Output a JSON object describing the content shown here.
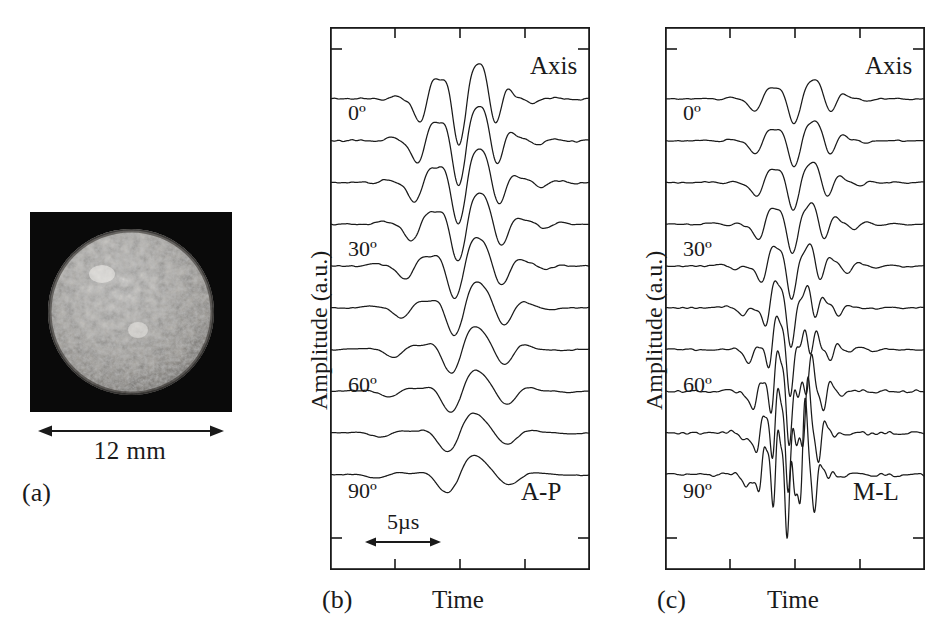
{
  "figure": {
    "type": "multi-panel scientific figure",
    "background": "#ffffff",
    "ink": "#1a1a1a"
  },
  "panel_a": {
    "tag": "(a)",
    "image_alt": "trabecular bone cylindrical specimen",
    "specimen_background": "#0a0a0a",
    "scale_label": "12 mm",
    "scale_arrow": "double-headed-arrow"
  },
  "panel_b": {
    "tag": "(b)",
    "xlabel": "Time",
    "ylabel": "Amplitude  (a.u.)",
    "top_annotation": "Axis",
    "direction_annotation": "A-P",
    "angle_labels": [
      "0º",
      "30º",
      "60º",
      "90º"
    ],
    "scale_label": "5µs"
  },
  "panel_c": {
    "tag": "(c)",
    "xlabel": "Time",
    "ylabel": "Amplitude  (a.u.)",
    "top_annotation": "Axis",
    "direction_annotation": "M-L",
    "angle_labels": [
      "0º",
      "30º",
      "60º",
      "90º"
    ]
  },
  "chart_data": {
    "type": "line",
    "title": "",
    "xlabel": "Time",
    "ylabel": "Amplitude  (a.u.)",
    "x_units": "µs",
    "x_scale_bar_us": 5,
    "grid": false,
    "legend": false,
    "n_traces_per_panel": 10,
    "trace_angles_deg": [
      0,
      10,
      20,
      30,
      40,
      50,
      60,
      70,
      80,
      90
    ],
    "panels": [
      {
        "name": "A-P",
        "tag": "(b)",
        "top_annotation": "Axis",
        "traces": [
          {
            "angle": 0,
            "amplitude": 1.0,
            "freq": 1.0,
            "center": 0.52,
            "width": 0.15,
            "tail": 1.0,
            "fast_slow": "merged"
          },
          {
            "angle": 10,
            "amplitude": 0.96,
            "freq": 0.98,
            "center": 0.52,
            "width": 0.155,
            "tail": 0.95
          },
          {
            "angle": 20,
            "amplitude": 0.88,
            "freq": 0.95,
            "center": 0.52,
            "width": 0.16,
            "tail": 0.9
          },
          {
            "angle": 30,
            "amplitude": 0.8,
            "freq": 0.92,
            "center": 0.52,
            "width": 0.165,
            "tail": 0.85
          },
          {
            "angle": 40,
            "amplitude": 0.7,
            "freq": 0.88,
            "center": 0.51,
            "width": 0.17,
            "tail": 0.8
          },
          {
            "angle": 50,
            "amplitude": 0.6,
            "freq": 0.84,
            "center": 0.51,
            "width": 0.175,
            "tail": 0.72
          },
          {
            "angle": 60,
            "amplitude": 0.52,
            "freq": 0.8,
            "center": 0.5,
            "width": 0.18,
            "tail": 0.65
          },
          {
            "angle": 70,
            "amplitude": 0.46,
            "freq": 0.76,
            "center": 0.5,
            "width": 0.185,
            "tail": 0.58
          },
          {
            "angle": 80,
            "amplitude": 0.42,
            "freq": 0.72,
            "center": 0.49,
            "width": 0.19,
            "tail": 0.52
          },
          {
            "angle": 90,
            "amplitude": 0.4,
            "freq": 0.7,
            "center": 0.49,
            "width": 0.195,
            "tail": 0.48
          }
        ],
        "bottom_annotation": "A-P"
      },
      {
        "name": "M-L",
        "tag": "(c)",
        "top_annotation": "Axis",
        "traces": [
          {
            "angle": 0,
            "amplitude": 1.0,
            "freq": 1.0,
            "center": 0.52,
            "width": 0.15,
            "tail": 1.0
          },
          {
            "angle": 10,
            "amplitude": 1.05,
            "freq": 1.0,
            "center": 0.52,
            "width": 0.148,
            "tail": 1.0
          },
          {
            "angle": 20,
            "amplitude": 1.12,
            "freq": 1.02,
            "center": 0.515,
            "width": 0.142,
            "tail": 0.95
          },
          {
            "angle": 30,
            "amplitude": 1.22,
            "freq": 1.05,
            "center": 0.51,
            "width": 0.135,
            "tail": 0.9
          },
          {
            "angle": 40,
            "amplitude": 1.4,
            "freq": 1.1,
            "center": 0.505,
            "width": 0.125,
            "tail": 0.82
          },
          {
            "angle": 50,
            "amplitude": 1.7,
            "freq": 1.16,
            "center": 0.5,
            "width": 0.112,
            "tail": 0.72
          },
          {
            "angle": 60,
            "amplitude": 2.1,
            "freq": 1.22,
            "center": 0.495,
            "width": 0.1,
            "tail": 0.62
          },
          {
            "angle": 70,
            "amplitude": 2.55,
            "freq": 1.28,
            "center": 0.49,
            "width": 0.09,
            "tail": 0.52
          },
          {
            "angle": 80,
            "amplitude": 2.95,
            "freq": 1.33,
            "center": 0.485,
            "width": 0.082,
            "tail": 0.45
          },
          {
            "angle": 90,
            "amplitude": 3.3,
            "freq": 1.38,
            "center": 0.48,
            "width": 0.076,
            "tail": 0.4
          }
        ],
        "bottom_annotation": "M-L"
      }
    ],
    "axis_ticks": {
      "bottom_major_count": 3,
      "top_major_count": 3,
      "left_ticks_count": 12
    }
  }
}
